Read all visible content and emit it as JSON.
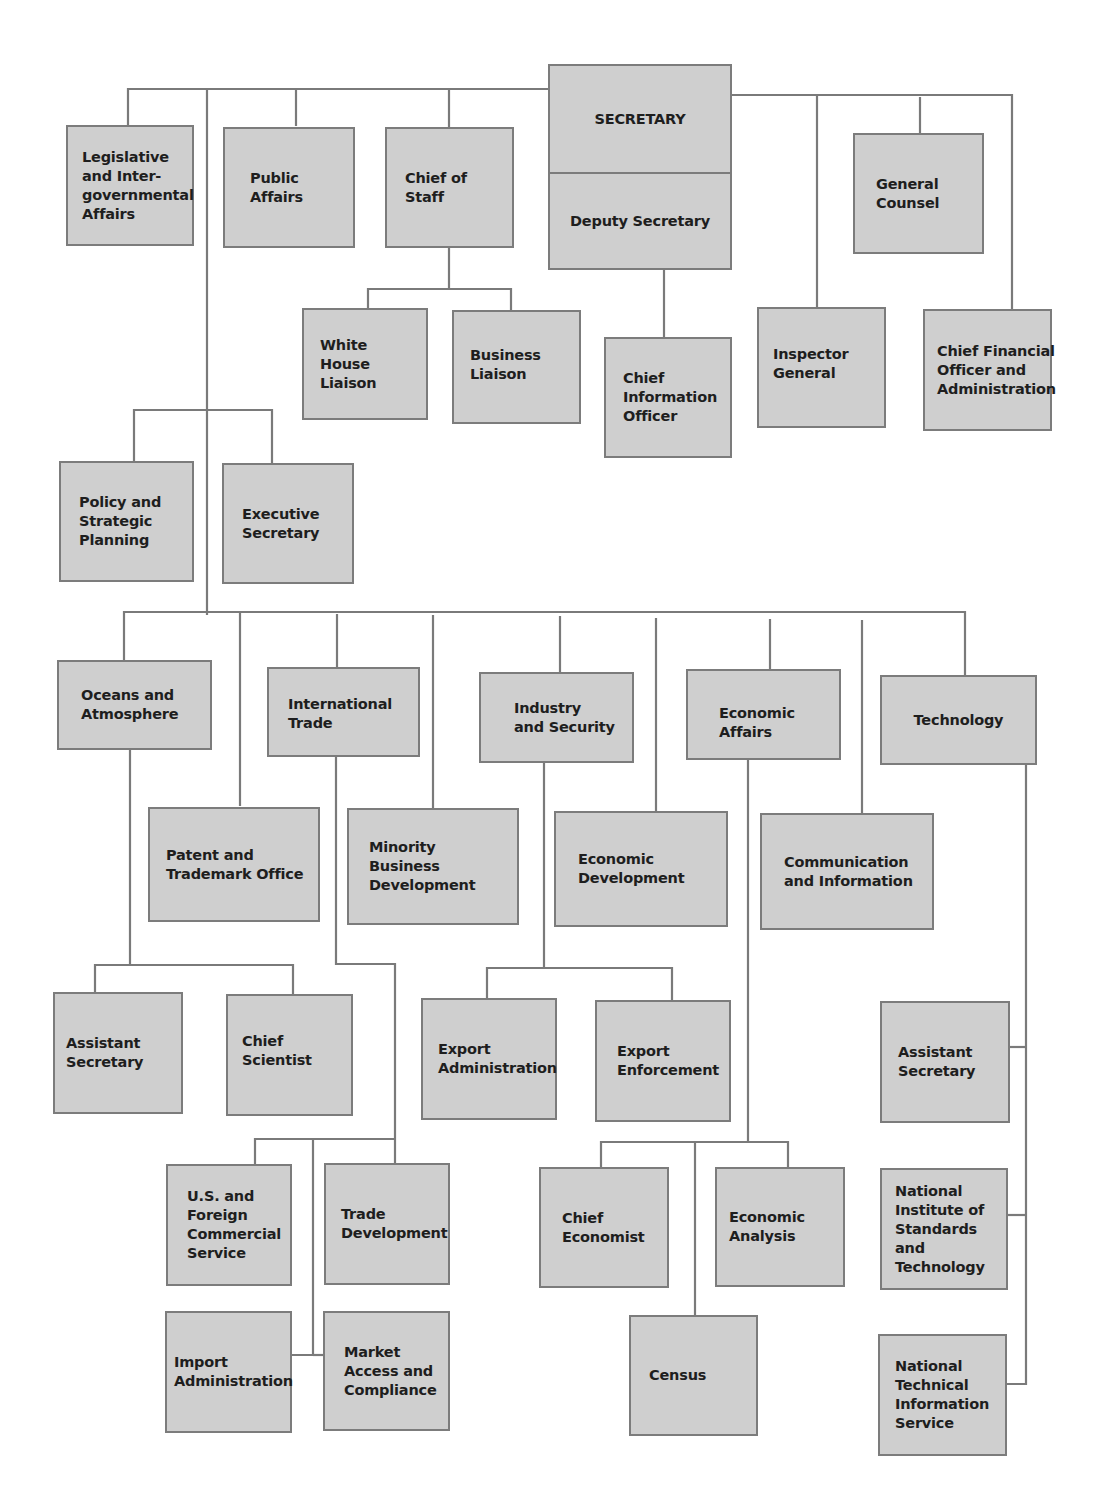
{
  "chart": {
    "title": "",
    "colors": {
      "box_fill": "#cfcfcf",
      "box_border": "#7c7c7c",
      "line": "#7a7a7a",
      "text": "#1e1e1e",
      "background": "#ffffff"
    },
    "top": {
      "secretary": "SECRETARY",
      "deputy_secretary": "Deputy Secretary",
      "legislative": "Legislative\nand Inter-\ngovernmental\nAffairs",
      "public_affairs": "Public\nAffairs",
      "chief_of_staff": "Chief of\nStaff",
      "general_counsel": "General\nCounsel",
      "white_house_liaison": "White\nHouse\nLiaison",
      "business_liaison": "Business\nLiaison",
      "chief_information_officer": "Chief\nInformation\nOfficer",
      "inspector_general": "Inspector\nGeneral",
      "cfo": "Chief Financial\nOfficer and\nAdministration",
      "policy_planning": "Policy and\nStrategic\nPlanning",
      "executive_secretary": "Executive\nSecretary"
    },
    "bureaus": {
      "oceans": "Oceans and\nAtmosphere",
      "international_trade": "International\nTrade",
      "industry_security": "Industry\nand Security",
      "economic_affairs": "Economic\nAffairs",
      "technology": "Technology",
      "patent_trademark": "Patent and\nTrademark Office",
      "minority_business": "Minority Business\nDevelopment",
      "economic_development": "Economic\nDevelopment",
      "communication_information": "Communication\nand Information"
    },
    "sub_units": {
      "oceans_assistant_secretary": "Assistant\nSecretary",
      "chief_scientist": "Chief\nScientist",
      "export_administration": "Export\nAdministration",
      "export_enforcement": "Export\nEnforcement",
      "us_foreign_commercial": "U.S. and\nForeign\nCommercial\nService",
      "trade_development": "Trade\nDevelopment",
      "import_administration": "Import\nAdministration",
      "market_access": "Market\nAccess and\nCompliance",
      "chief_economist": "Chief\nEconomist",
      "economic_analysis": "Economic\nAnalysis",
      "census": "Census",
      "tech_assistant_secretary": "Assistant\nSecretary",
      "nist": "National\nInstitute of\nStandards and\nTechnology",
      "ntis": "National\nTechnical\nInformation\nService"
    }
  }
}
